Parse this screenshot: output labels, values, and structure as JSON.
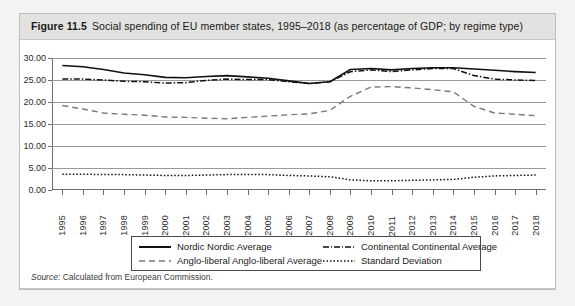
{
  "figure": {
    "number": "Figure 11.5",
    "caption": "Social spending of EU member states, 1995–2018 (as percentage of GDP; by regime type)"
  },
  "source": {
    "label": "Source:",
    "text": "Calculated from European Commission."
  },
  "legend": {
    "nordic": "Nordic  Nordic Average",
    "anglo": "Anglo-liberal Anglo-liberal Average",
    "continental": "Continental Continental Average",
    "stddev": "Standard Deviation"
  },
  "chart_data": {
    "type": "line",
    "title": "Social spending of EU member states, 1995–2018 (as percentage of GDP; by regime type)",
    "xlabel": "",
    "ylabel": "",
    "ylim": [
      0,
      30
    ],
    "ytick_labels": [
      "0.00",
      "5.00",
      "10.00",
      "15.00",
      "20.00",
      "25.00",
      "30.00"
    ],
    "ytick_values": [
      0,
      5,
      10,
      15,
      20,
      25,
      30
    ],
    "grid": true,
    "legend_position": "bottom",
    "x": [
      1995,
      1996,
      1997,
      1998,
      1999,
      2000,
      2001,
      2002,
      2003,
      2004,
      2005,
      2006,
      2007,
      2008,
      2009,
      2010,
      2011,
      2012,
      2013,
      2014,
      2015,
      2016,
      2017,
      2018
    ],
    "categories": [
      "1995",
      "1996",
      "1997",
      "1998",
      "1999",
      "2000",
      "2001",
      "2002",
      "2003",
      "2004",
      "2005",
      "2006",
      "2007",
      "2008",
      "2009",
      "2010",
      "2011",
      "2012",
      "2013",
      "2014",
      "2015",
      "2016",
      "2017",
      "2018"
    ],
    "series": [
      {
        "name": "Nordic  Nordic Average",
        "style": "solid",
        "color": "#111111",
        "values": [
          28.3,
          28.0,
          27.4,
          26.6,
          26.2,
          25.6,
          25.5,
          25.8,
          26.0,
          25.7,
          25.4,
          24.8,
          24.2,
          24.6,
          27.4,
          27.6,
          27.3,
          27.6,
          27.8,
          27.8,
          27.5,
          27.2,
          26.9,
          26.7
        ]
      },
      {
        "name": "Continental Continental Average",
        "style": "dash-dot",
        "color": "#111111",
        "values": [
          25.2,
          25.2,
          25.0,
          24.7,
          24.6,
          24.3,
          24.4,
          24.9,
          25.2,
          25.1,
          25.1,
          24.6,
          24.2,
          24.6,
          26.9,
          27.3,
          26.9,
          27.3,
          27.6,
          27.6,
          26.0,
          25.2,
          25.0,
          24.9
        ]
      },
      {
        "name": "Anglo-liberal Anglo-liberal Average",
        "style": "dashed",
        "color": "#7a7a7a",
        "values": [
          19.2,
          18.4,
          17.5,
          17.2,
          17.0,
          16.6,
          16.5,
          16.3,
          16.2,
          16.5,
          16.8,
          17.1,
          17.3,
          18.1,
          21.3,
          23.4,
          23.5,
          23.2,
          22.8,
          22.3,
          19.0,
          17.5,
          17.2,
          16.9
        ]
      },
      {
        "name": "Standard Deviation",
        "style": "dotted",
        "color": "#111111",
        "values": [
          3.6,
          3.6,
          3.5,
          3.5,
          3.4,
          3.3,
          3.3,
          3.4,
          3.5,
          3.5,
          3.5,
          3.3,
          3.2,
          3.0,
          2.3,
          2.1,
          2.1,
          2.2,
          2.3,
          2.4,
          2.9,
          3.2,
          3.3,
          3.4
        ]
      }
    ]
  }
}
